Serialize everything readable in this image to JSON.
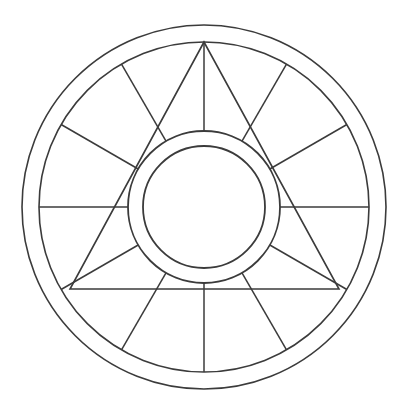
{
  "figure": {
    "background_color": "#ffffff",
    "line_color": "#3b3b3b",
    "line_width": 1.5,
    "width": 404,
    "height": 414
  },
  "chart_data": {
    "type": "diagram",
    "subtitle": "",
    "xlabel": "",
    "ylabel": "",
    "grid": false,
    "legend": "none",
    "center": {
      "x": 204,
      "y": 207
    },
    "circles": [
      {
        "name": "outer-rim-circle",
        "radius": 182
      },
      {
        "name": "ring-boundary-circle",
        "radius": 165
      },
      {
        "name": "hub-outer-circle",
        "radius": 76
      },
      {
        "name": "hub-inner-circle",
        "radius": 61
      }
    ],
    "spokes": {
      "count": 12,
      "start_radius": 76,
      "end_radius": 165,
      "angles_deg": [
        0,
        30,
        60,
        90,
        120,
        150,
        180,
        210,
        240,
        270,
        300,
        330
      ]
    },
    "triangle": {
      "name": "inscribed-triangle",
      "vertices": [
        {
          "x": 204,
          "y": 42
        },
        {
          "x": 70,
          "y": 289
        },
        {
          "x": 339,
          "y": 289
        }
      ],
      "vertex_angles_deg": [
        90,
        210,
        330
      ],
      "circumradius": 165
    }
  },
  "labels": {
    "outer_rim": "outer rim",
    "inner_ring": "inner ring band",
    "hub": "central hub",
    "spokes": "radial spokes",
    "triangle": "inscribed triangle"
  }
}
